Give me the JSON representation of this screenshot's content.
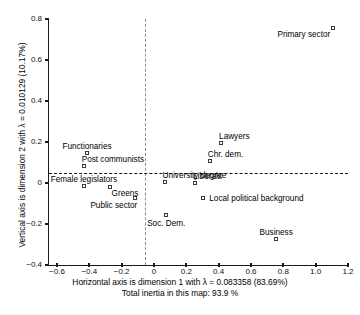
{
  "chart_data": {
    "type": "scatter",
    "title": "",
    "xlabel": "Horizontal axis is dimension 1 with λ = 0.083358  (83.69%)",
    "xlabel_line2": "Total inertia in this map: 93.9 %",
    "ylabel": "Vertical axis is dimension 2 with λ = 0.010129  (10.17%)",
    "xlim": [
      -0.6,
      1.2
    ],
    "ylim": [
      -0.4,
      0.8
    ],
    "xticks": [
      "−0.6",
      "−0.4",
      "−0.2",
      "0",
      "0.2",
      "0.4",
      "0.6",
      "0.8",
      "1.0",
      "1.2"
    ],
    "xtick_values": [
      -0.6,
      -0.4,
      -0.2,
      0,
      0.2,
      0.4,
      0.6,
      0.8,
      1.0,
      1.2
    ],
    "yticks": [
      "0.8",
      "0.6",
      "0.4",
      "0.2",
      "0",
      "−0.2",
      "−0.4"
    ],
    "ytick_values": [
      0.8,
      0.6,
      0.4,
      0.2,
      0,
      -0.2,
      -0.4
    ],
    "grid": false,
    "legend": "none",
    "reference_lines": {
      "vertical_x": 0,
      "horizontal_y": 0,
      "style": "dashed"
    },
    "marker_style": "open-square",
    "points": [
      {
        "label": "Primary sector",
        "x": 1.11,
        "y": 0.755,
        "label_pos": "left"
      },
      {
        "label": "Lawyers",
        "x": 0.415,
        "y": 0.195,
        "label_pos": "above-right"
      },
      {
        "label": "Chr. dem.",
        "x": 0.345,
        "y": 0.105,
        "label_pos": "above-right"
      },
      {
        "label": "University degree",
        "x": 0.065,
        "y": 0.005,
        "label_pos": "above-right"
      },
      {
        "label": "Liberals",
        "x": 0.255,
        "y": 0.0,
        "label_pos": "above-right"
      },
      {
        "label": "Local political background",
        "x": 0.305,
        "y": -0.075,
        "label_pos": "right"
      },
      {
        "label": "Business",
        "x": 0.755,
        "y": -0.275,
        "label_pos": "above"
      },
      {
        "label": "Soc. Dem.",
        "x": 0.075,
        "y": -0.155,
        "label_pos": "below"
      },
      {
        "label": "Functionaries",
        "x": -0.415,
        "y": 0.145,
        "label_pos": "above"
      },
      {
        "label": "Post communists",
        "x": -0.435,
        "y": 0.085,
        "label_pos": "above-right"
      },
      {
        "label": "Female legislators",
        "x": -0.435,
        "y": -0.015,
        "label_pos": "above"
      },
      {
        "label": "Greens",
        "x": -0.275,
        "y": -0.02,
        "label_pos": "below-right"
      },
      {
        "label": "Public sector",
        "x": -0.115,
        "y": -0.075,
        "label_pos": "below-left"
      }
    ]
  },
  "caption": ""
}
